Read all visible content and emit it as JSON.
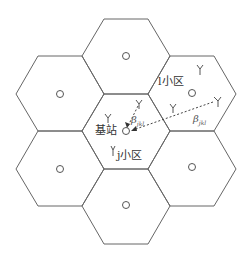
{
  "diagram": {
    "type": "hexagonal-cellular-network",
    "cells": [
      "top",
      "top-left",
      "top-right",
      "center",
      "bottom-left",
      "bottom-right",
      "bottom"
    ],
    "labels": {
      "base_station": "基站",
      "cell_j": "j小区",
      "cell_l": "l小区",
      "beta_center": "β",
      "beta_center_sub": "jkl",
      "beta_right": "β",
      "beta_right_sub": "jkl"
    },
    "colors": {
      "stroke": "#555555",
      "dashed": "#444444",
      "text": "#333333"
    }
  }
}
